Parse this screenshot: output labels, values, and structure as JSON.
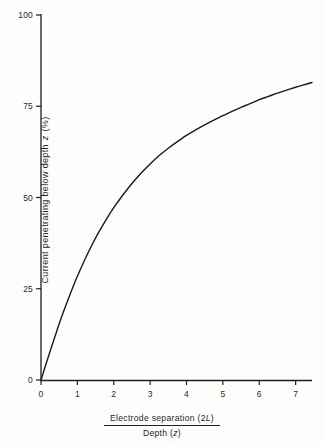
{
  "figure": {
    "background_color": "#fdfdfc",
    "ink_color": "#1f1f1f"
  },
  "chart_data": {
    "type": "line",
    "title": "",
    "subtitle": "",
    "xlabel_numerator": "Electrode   separation (2L)",
    "xlabel_denominator": "Depth (z)",
    "xlabel_numerator_text": "Electrode   separation (2",
    "xlabel_numerator_italic": "L",
    "xlabel_numerator_close": ")",
    "xlabel_denominator_text": "Depth (",
    "xlabel_denominator_italic": "z",
    "xlabel_denominator_close": ")",
    "ylabel": "Current penetrating below depth z (%)",
    "ylabel_pre": "Current  penetrating  below  depth ",
    "ylabel_italic": "z",
    "ylabel_post": " (%)",
    "xlim": [
      0,
      7.45
    ],
    "ylim": [
      0,
      100
    ],
    "xticks": [
      0,
      1,
      2,
      3,
      4,
      5,
      6,
      7
    ],
    "xtick_labels": [
      "0",
      "1",
      "2",
      "3",
      "4",
      "5",
      "6",
      "7"
    ],
    "yticks": [
      0,
      25,
      50,
      75,
      100
    ],
    "ytick_labels": [
      "0",
      "25",
      "50",
      "75",
      "100"
    ],
    "grid": false,
    "legend": false,
    "series": [
      {
        "name": "Current penetrating below depth z",
        "color": "#1a1a1a",
        "line_width": 1.4,
        "x": [
          0,
          0.1,
          0.2,
          0.3,
          0.4,
          0.5,
          0.6,
          0.7,
          0.8,
          0.9,
          1.0,
          1.2,
          1.4,
          1.6,
          1.8,
          2.0,
          2.2,
          2.4,
          2.6,
          2.8,
          3.0,
          3.25,
          3.5,
          3.75,
          4.0,
          4.25,
          4.5,
          4.75,
          5.0,
          5.25,
          5.5,
          5.75,
          6.0,
          6.25,
          6.5,
          6.75,
          7.0,
          7.2,
          7.45
        ],
        "y": [
          0,
          3.2,
          6.3,
          9.4,
          12.4,
          15.4,
          18.2,
          20.9,
          23.5,
          26.0,
          28.4,
          32.9,
          37.0,
          40.7,
          44.1,
          47.2,
          50.0,
          52.6,
          55.0,
          57.2,
          59.2,
          61.5,
          63.5,
          65.3,
          67.0,
          68.5,
          69.9,
          71.2,
          72.4,
          73.6,
          74.7,
          75.7,
          76.8,
          77.7,
          78.6,
          79.4,
          80.2,
          80.8,
          81.5
        ]
      }
    ],
    "annotations": []
  },
  "axis": {
    "x_axis_name": "x-axis-line",
    "y_axis_name": "y-axis-line"
  }
}
